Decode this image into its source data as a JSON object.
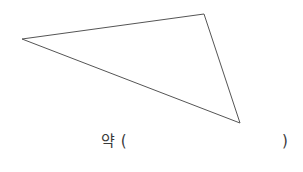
{
  "figure": {
    "shape_name": "triangle",
    "stroke_color": "#555555",
    "stroke_width": 1,
    "fill": "none",
    "background_color": "#ffffff",
    "vertices": [
      {
        "label": "left-vertex",
        "x": 22,
        "y": 39
      },
      {
        "label": "top-right-vertex",
        "x": 204,
        "y": 14
      },
      {
        "label": "bottom-right-vertex",
        "x": 240,
        "y": 123
      }
    ],
    "points_path": "22,39 204,14 240,123"
  },
  "answer": {
    "prefix": "약 (",
    "suffix": ")",
    "blank_value": ""
  }
}
